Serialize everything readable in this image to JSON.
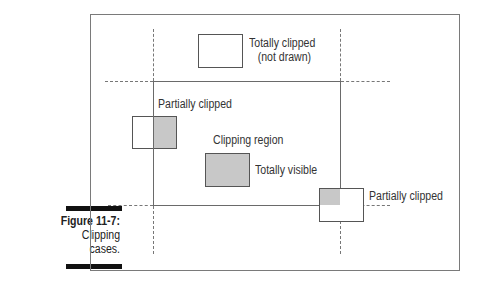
{
  "figure": {
    "number": "Figure 11-7:",
    "caption_lines": [
      "Clipping",
      "cases."
    ]
  },
  "diagram": {
    "labels": {
      "totally_clipped_line1": "Totally clipped",
      "totally_clipped_line2": "(not drawn)",
      "partially_clipped_left": "Partially clipped",
      "clipping_region": "Clipping region",
      "totally_visible": "Totally visible",
      "partially_clipped_right": "Partially clipped"
    },
    "colors": {
      "visible_fill": "#c8c8c8",
      "outline": "#555555",
      "frame": "#7a7a7a"
    }
  }
}
